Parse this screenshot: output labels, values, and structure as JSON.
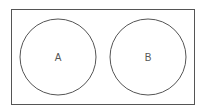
{
  "diagram": {
    "type": "venn",
    "universal_set": {
      "label": ""
    },
    "sets": [
      {
        "label": "A"
      },
      {
        "label": "B"
      }
    ],
    "overlap": false,
    "stroke_color": "#555555",
    "background": "#ffffff"
  }
}
